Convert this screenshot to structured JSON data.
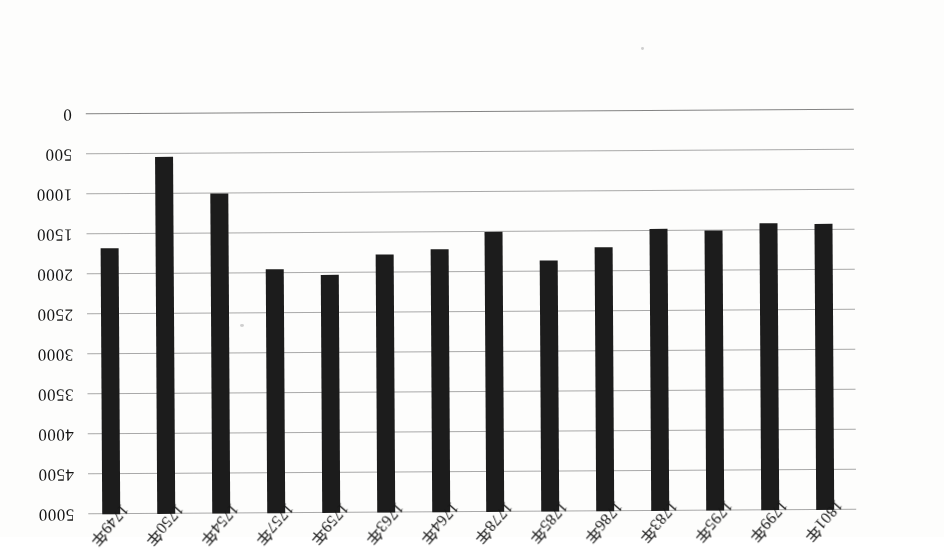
{
  "figure": {
    "orientation": "rotated-180",
    "background_color": "#fdfdfc",
    "bar_color": "#1c1c1c",
    "gridline_color": "#9a9a9a"
  },
  "chart_data": {
    "type": "bar",
    "title": "",
    "subtitle": "",
    "xlabel": "",
    "ylabel": "",
    "orientation": "vertical-inverted",
    "grid": true,
    "legend": null,
    "ylim": [
      0,
      5000
    ],
    "ytick_step": 500,
    "ytick_labels": [
      "0",
      "500",
      "1000",
      "1500",
      "2000",
      "2500",
      "3000",
      "3500",
      "4000",
      "4500",
      "5000"
    ],
    "ytick_values": [
      0,
      500,
      1000,
      1500,
      2000,
      2500,
      3000,
      3500,
      4000,
      4500,
      5000
    ],
    "categories": [
      "1801年",
      "1799年",
      "1795年",
      "1783年",
      "1786年",
      "1785年",
      "1778年",
      "1764年",
      "1763年",
      "1759年",
      "1757年",
      "1754年",
      "1750年",
      "1749年"
    ],
    "values": [
      3570,
      3590,
      3500,
      3520,
      3300,
      3140,
      3500,
      3290,
      3220,
      2970,
      3050,
      4000,
      4460,
      3320
    ]
  }
}
